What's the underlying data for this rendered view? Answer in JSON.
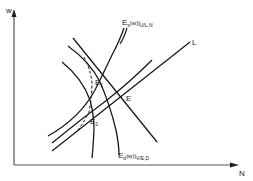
{
  "diagram": {
    "axes": {
      "y_label": "w",
      "x_label": "N"
    },
    "curves": {
      "line_L": "L",
      "curve_V": "V",
      "supply_label_main": "E",
      "supply_label_sub": "s",
      "supply_label_fn": "(w)|",
      "supply_label_cond": "U/L,N",
      "demand_label_main": "E",
      "demand_label_sub": "d",
      "demand_label_fn": "(w)|",
      "demand_label_cond": "V/E,D"
    },
    "points": {
      "E": "E",
      "E1_main": "E",
      "E1_sub": "1",
      "E2_main": "E",
      "E2_sub": "2"
    },
    "colors": {
      "line": "#1a1a1a",
      "axis": "#333333"
    }
  }
}
